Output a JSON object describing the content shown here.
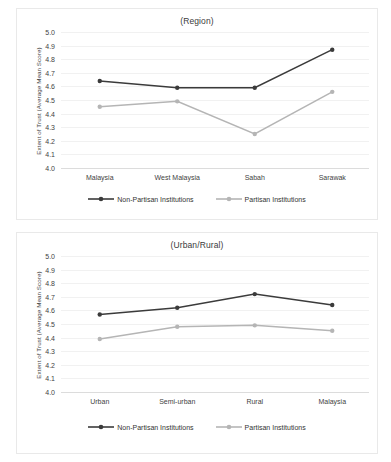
{
  "chart_data": [
    {
      "type": "line",
      "title": "(Region)",
      "xlabel": "",
      "ylabel": "Extent of Trust (Average Mean Score)",
      "categories": [
        "Malaysia",
        "West Malaysia",
        "Sabah",
        "Sarawak"
      ],
      "ylim": [
        4.0,
        5.0
      ],
      "ytick_labels": [
        "5.0",
        "4.9",
        "4.8",
        "4.7",
        "4.6",
        "4.5",
        "4.4",
        "4.3",
        "4.2",
        "4.1",
        "4.0"
      ],
      "ytick_values": [
        5.0,
        4.9,
        4.8,
        4.7,
        4.6,
        4.5,
        4.4,
        4.3,
        4.2,
        4.1,
        4.0
      ],
      "grid": true,
      "legend_position": "bottom",
      "series": [
        {
          "name": "Non-Partisan Institutions",
          "color": "#3b3b3b",
          "values": [
            4.64,
            4.59,
            4.59,
            4.87
          ]
        },
        {
          "name": "Partisan Institutions",
          "color": "#b5b5b5",
          "values": [
            4.45,
            4.49,
            4.25,
            4.56
          ]
        }
      ]
    },
    {
      "type": "line",
      "title": "(Urban/Rural)",
      "xlabel": "",
      "ylabel": "Extent of Trust (Average Mean Score)",
      "categories": [
        "Urban",
        "Semi-urban",
        "Rural",
        "Malaysia"
      ],
      "ylim": [
        4.0,
        5.0
      ],
      "ytick_labels": [
        "5.0",
        "4.9",
        "4.8",
        "4.7",
        "4.6",
        "4.5",
        "4.4",
        "4.3",
        "4.2",
        "4.1",
        "4.0"
      ],
      "ytick_values": [
        5.0,
        4.9,
        4.8,
        4.7,
        4.6,
        4.5,
        4.4,
        4.3,
        4.2,
        4.1,
        4.0
      ],
      "grid": true,
      "legend_position": "bottom",
      "series": [
        {
          "name": "Non-Partisan Institutions",
          "color": "#3b3b3b",
          "values": [
            4.57,
            4.62,
            4.72,
            4.64
          ]
        },
        {
          "name": "Partisan Institutions",
          "color": "#b5b5b5",
          "values": [
            4.39,
            4.48,
            4.49,
            4.45
          ]
        }
      ]
    }
  ],
  "panels": {
    "region": {
      "title": "(Region)",
      "ylabel": "Extent of Trust (Average Mean Score)",
      "legend": {
        "non_partisan": "Non-Partisan Institutions",
        "partisan": "Partisan Institutions"
      }
    },
    "urban": {
      "title": "(Urban/Rural)",
      "ylabel": "Extent of Trust (Average Mean Score)",
      "legend": {
        "non_partisan": "Non-Partisan Institutions",
        "partisan": "Partisan Institutions"
      }
    }
  }
}
